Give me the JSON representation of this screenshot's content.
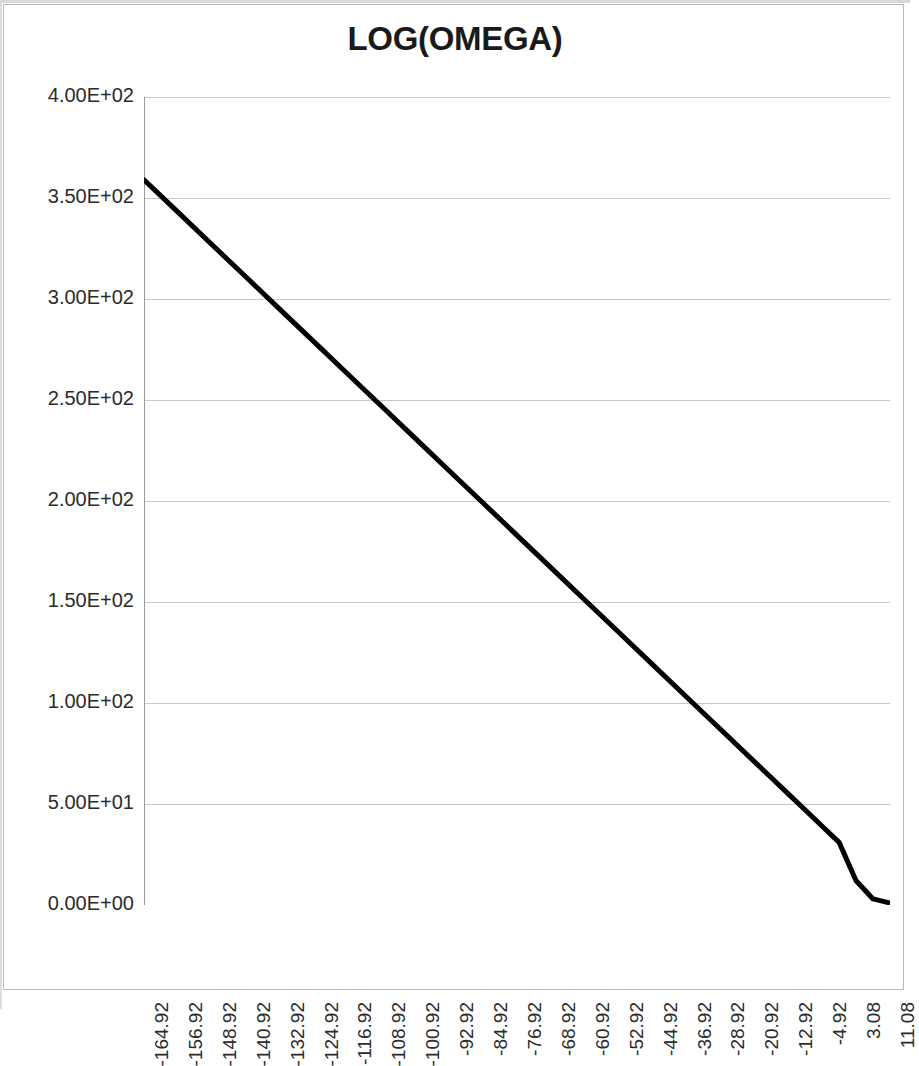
{
  "chart_data": {
    "type": "line",
    "title": "LOG(OMEGA)",
    "xlabel": "",
    "ylabel": "",
    "grid": true,
    "legend": false,
    "ylim": [
      0,
      400
    ],
    "xlim": [
      -164.92,
      11.08
    ],
    "y_ticks": [
      0,
      50,
      100,
      150,
      200,
      250,
      300,
      350,
      400
    ],
    "y_tick_labels": [
      "0.00E+00",
      "5.00E+01",
      "1.00E+02",
      "1.50E+02",
      "2.00E+02",
      "2.50E+02",
      "3.00E+02",
      "3.50E+02",
      "4.00E+02"
    ],
    "x_tick_labels": [
      "-164.92",
      "-156.92",
      "-148.92",
      "-140.92",
      "-132.92",
      "-124.92",
      "-116.92",
      "-108.92",
      "-100.92",
      "-92.92",
      "-84.92",
      "-76.92",
      "-68.92",
      "-60.92",
      "-52.92",
      "-44.92",
      "-36.92",
      "-28.92",
      "-20.92",
      "-12.92",
      "-4.92",
      "3.08",
      "11.08"
    ],
    "x_tick_values": [
      -164.92,
      -156.92,
      -148.92,
      -140.92,
      -132.92,
      -124.92,
      -116.92,
      -108.92,
      -100.92,
      -92.92,
      -84.92,
      -76.92,
      -68.92,
      -60.92,
      -52.92,
      -44.92,
      -36.92,
      -28.92,
      -20.92,
      -12.92,
      -4.92,
      3.08,
      11.08
    ],
    "series": [
      {
        "name": "LOG(OMEGA)",
        "color": "#000000",
        "line_width": 5,
        "x": [
          -164.92,
          -156.92,
          -148.92,
          -140.92,
          -132.92,
          -124.92,
          -116.92,
          -108.92,
          -100.92,
          -92.92,
          -84.92,
          -76.92,
          -68.92,
          -60.92,
          -52.92,
          -44.92,
          -36.92,
          -28.92,
          -20.92,
          -12.92,
          -8.92,
          -4.92,
          -0.92,
          3.08,
          7.08,
          11.08
        ],
        "values": [
          359,
          343,
          327,
          311,
          295,
          279,
          263,
          247,
          231,
          215,
          199,
          183,
          167,
          151,
          135,
          119,
          103,
          87,
          71,
          55,
          47,
          39,
          31,
          12,
          3,
          1
        ]
      }
    ]
  }
}
